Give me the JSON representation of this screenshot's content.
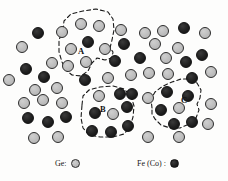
{
  "figure": {
    "width": 228,
    "height": 181,
    "background_color": "#fdfdfc"
  },
  "colors": {
    "ge_fill": "#bdbdbd",
    "ge_stroke": "#2b2b2b",
    "fe_fill": "#1d1d1d",
    "fe_stroke": "#111111",
    "cluster_outline": "#1a1a1a"
  },
  "legend": {
    "items": [
      {
        "id": "legend-ge",
        "label": "Ge:",
        "marker": "ge-circle-icon",
        "type": "ge"
      },
      {
        "id": "legend-fe",
        "label": "Fe (Co) :",
        "marker": "fe-circle-icon",
        "type": "fe"
      }
    ]
  },
  "clusters": [
    {
      "id": "A",
      "label": "A",
      "label_x": 78,
      "label_y": 47,
      "path": "M 63,30 L 64,21 L 71,14 L 83,11 L 96,9 L 108,12 L 113,19 L 114,30 L 112,40 L 110,48 L 113,52 L 112,58 L 105,60 L 97,58 L 92,63 L 88,71 L 81,76 L 72,75 L 66,70 L 62,62 L 59,52 L 59,40 Z"
    },
    {
      "id": "B",
      "label": "B",
      "label_x": 100,
      "label_y": 105,
      "path": "M 82,105 L 83,96 L 89,90 L 100,87 L 113,86 L 124,89 L 131,96 L 134,106 L 133,117 L 130,127 L 124,134 L 113,137 L 100,137 L 89,135 L 83,128 L 81,118 Z"
    },
    {
      "id": "C",
      "label": "C",
      "label_x": 181,
      "label_y": 96,
      "path": "M 152,108 L 151,99 L 155,92 L 163,86 L 172,82 L 181,79 L 190,79 L 197,83 L 201,90 L 200,98 L 197,104 L 199,110 L 196,118 L 189,124 L 180,128 L 170,128 L 161,125 L 155,119 L 152,114 Z"
    }
  ],
  "atoms": [
    {
      "type": "fe",
      "x": 38,
      "y": 33,
      "r": 6.0
    },
    {
      "type": "ge",
      "x": 22,
      "y": 47,
      "r": 6.0
    },
    {
      "type": "ge",
      "x": 9,
      "y": 80,
      "r": 6.0
    },
    {
      "type": "fe",
      "x": 26,
      "y": 69,
      "r": 6.0
    },
    {
      "type": "ge",
      "x": 35,
      "y": 90,
      "r": 6.0
    },
    {
      "type": "fe",
      "x": 44,
      "y": 77,
      "r": 6.0
    },
    {
      "type": "ge",
      "x": 52,
      "y": 63,
      "r": 6.0
    },
    {
      "type": "ge",
      "x": 57,
      "y": 88,
      "r": 6.0
    },
    {
      "type": "ge",
      "x": 24,
      "y": 103,
      "r": 6.0
    },
    {
      "type": "ge",
      "x": 43,
      "y": 100,
      "r": 6.0
    },
    {
      "type": "ge",
      "x": 62,
      "y": 103,
      "r": 6.0
    },
    {
      "type": "fe",
      "x": 28,
      "y": 118,
      "r": 6.0
    },
    {
      "type": "fe",
      "x": 48,
      "y": 122,
      "r": 6.0
    },
    {
      "type": "fe",
      "x": 66,
      "y": 117,
      "r": 6.0
    },
    {
      "type": "ge",
      "x": 34,
      "y": 138,
      "r": 6.0
    },
    {
      "type": "ge",
      "x": 58,
      "y": 137,
      "r": 6.0
    },
    {
      "type": "ge",
      "x": 62,
      "y": 32,
      "r": 6.0
    },
    {
      "type": "ge",
      "x": 81,
      "y": 24,
      "r": 6.0
    },
    {
      "type": "ge",
      "x": 99,
      "y": 26,
      "r": 6.0
    },
    {
      "type": "ge",
      "x": 71,
      "y": 49,
      "r": 6.0
    },
    {
      "type": "fe",
      "x": 88,
      "y": 42,
      "r": 6.0
    },
    {
      "type": "ge",
      "x": 105,
      "y": 49,
      "r": 6.0
    },
    {
      "type": "ge",
      "x": 68,
      "y": 66,
      "r": 6.0
    },
    {
      "type": "ge",
      "x": 86,
      "y": 62,
      "r": 6.0
    },
    {
      "type": "fe",
      "x": 85,
      "y": 80,
      "r": 6.0
    },
    {
      "type": "ge",
      "x": 121,
      "y": 30,
      "r": 6.0
    },
    {
      "type": "fe",
      "x": 124,
      "y": 44,
      "r": 6.0
    },
    {
      "type": "fe",
      "x": 115,
      "y": 61,
      "r": 6.0
    },
    {
      "type": "ge",
      "x": 108,
      "y": 78,
      "r": 6.0
    },
    {
      "type": "ge",
      "x": 145,
      "y": 33,
      "r": 6.0
    },
    {
      "type": "ge",
      "x": 163,
      "y": 31,
      "r": 6.0
    },
    {
      "type": "fe",
      "x": 184,
      "y": 28,
      "r": 6.0
    },
    {
      "type": "ge",
      "x": 205,
      "y": 33,
      "r": 6.0
    },
    {
      "type": "ge",
      "x": 155,
      "y": 44,
      "r": 6.0
    },
    {
      "type": "ge",
      "x": 178,
      "y": 48,
      "r": 6.0
    },
    {
      "type": "fe",
      "x": 140,
      "y": 58,
      "r": 6.0
    },
    {
      "type": "fe",
      "x": 202,
      "y": 55,
      "r": 6.0
    },
    {
      "type": "ge",
      "x": 166,
      "y": 58,
      "r": 6.0
    },
    {
      "type": "fe",
      "x": 186,
      "y": 62,
      "r": 6.0
    },
    {
      "type": "ge",
      "x": 131,
      "y": 75,
      "r": 6.0
    },
    {
      "type": "ge",
      "x": 149,
      "y": 73,
      "r": 6.0
    },
    {
      "type": "ge",
      "x": 168,
      "y": 74,
      "r": 6.0
    },
    {
      "type": "fe",
      "x": 192,
      "y": 78,
      "r": 6.0
    },
    {
      "type": "ge",
      "x": 211,
      "y": 72,
      "r": 6.0
    },
    {
      "type": "fe",
      "x": 132,
      "y": 94,
      "r": 6.0
    },
    {
      "type": "ge",
      "x": 148,
      "y": 98,
      "r": 6.0
    },
    {
      "type": "fe",
      "x": 167,
      "y": 92,
      "r": 6.0
    },
    {
      "type": "fe",
      "x": 188,
      "y": 96,
      "r": 6.0
    },
    {
      "type": "fe",
      "x": 161,
      "y": 110,
      "r": 6.0
    },
    {
      "type": "ge",
      "x": 179,
      "y": 108,
      "r": 6.0
    },
    {
      "type": "ge",
      "x": 211,
      "y": 104,
      "r": 6.0
    },
    {
      "type": "fe",
      "x": 174,
      "y": 124,
      "r": 6.0
    },
    {
      "type": "fe",
      "x": 192,
      "y": 122,
      "r": 6.0
    },
    {
      "type": "ge",
      "x": 208,
      "y": 124,
      "r": 6.0
    },
    {
      "type": "ge",
      "x": 148,
      "y": 137,
      "r": 6.0
    },
    {
      "type": "ge",
      "x": 179,
      "y": 137,
      "r": 6.0
    },
    {
      "type": "ge",
      "x": 99,
      "y": 96,
      "r": 6.0
    },
    {
      "type": "fe",
      "x": 120,
      "y": 94,
      "r": 6.0
    },
    {
      "type": "fe",
      "x": 95,
      "y": 113,
      "r": 6.0
    },
    {
      "type": "ge",
      "x": 113,
      "y": 114,
      "r": 6.0
    },
    {
      "type": "fe",
      "x": 127,
      "y": 107,
      "r": 6.0
    },
    {
      "type": "fe",
      "x": 128,
      "y": 126,
      "r": 6.0
    },
    {
      "type": "fe",
      "x": 92,
      "y": 131,
      "r": 6.0
    },
    {
      "type": "fe",
      "x": 111,
      "y": 132,
      "r": 6.0
    }
  ]
}
